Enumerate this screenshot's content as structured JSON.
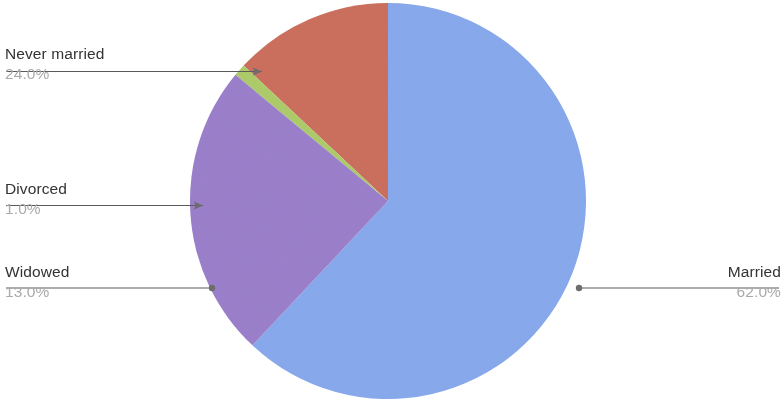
{
  "chart_data": {
    "type": "pie",
    "title": "",
    "categories": [
      "Married",
      "Never married",
      "Widowed",
      "Divorced"
    ],
    "values": [
      62.0,
      24.0,
      13.0,
      1.0
    ],
    "value_unit": "%",
    "legend": "none",
    "start_angle_deg": 0,
    "direction": "clockwise",
    "slices": [
      {
        "label": "Married",
        "value": "62.0%",
        "value_number": 62.0,
        "color": "#88a9ec"
      },
      {
        "label": "Never married",
        "value": "24.0%",
        "value_number": 24.0,
        "color": "#9b7fcb"
      },
      {
        "label": "Divorced",
        "value": "1.0%",
        "value_number": 1.0,
        "color": "#aecc6b"
      },
      {
        "label": "Widowed",
        "value": "13.0%",
        "value_number": 13.0,
        "color": "#cc6f5e"
      }
    ]
  },
  "callouts": {
    "never_married": {
      "label": "Never married",
      "value": "24.0%"
    },
    "divorced": {
      "label": "Divorced",
      "value": "1.0%"
    },
    "widowed": {
      "label": "Widowed",
      "value": "13.0%"
    },
    "married": {
      "label": "Married",
      "value": "62.0%"
    }
  },
  "colors": {
    "married": "#88a9ec",
    "never_married": "#9b7fcb",
    "divorced": "#aecc6b",
    "widowed": "#cc6f5e",
    "label_text": "#333333",
    "value_text": "#aaaaaa",
    "leader_line": "#5a5a5a",
    "background": "#ffffff"
  }
}
